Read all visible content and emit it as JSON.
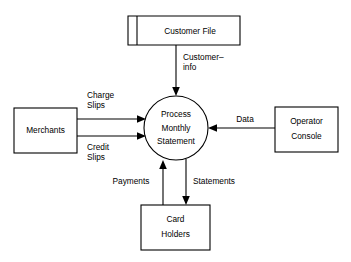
{
  "diagram": {
    "type": "data-flow-diagram",
    "nodes": {
      "data_store": {
        "label": "Customer File",
        "shape": "open-ended-rectangle"
      },
      "process": {
        "label_line1": "Process",
        "label_line2": "Monthly",
        "label_line3": "Statement",
        "shape": "circle"
      },
      "merchants": {
        "label": "Merchants",
        "shape": "rectangle"
      },
      "operator_console": {
        "label_line1": "Operator",
        "label_line2": "Console",
        "shape": "rectangle"
      },
      "card_holders": {
        "label_line1": "Card",
        "label_line2": "Holders",
        "shape": "rectangle"
      }
    },
    "flows": [
      {
        "id": "customer-info",
        "label_line1": "Customer–",
        "label_line2": "info",
        "from": "Customer File",
        "to": "Process Monthly Statement",
        "direction": "down"
      },
      {
        "id": "charge-slips",
        "label_line1": "Charge",
        "label_line2": "Slips",
        "from": "Merchants",
        "to": "Process Monthly Statement",
        "direction": "right"
      },
      {
        "id": "credit-slips",
        "label_line1": "Credit",
        "label_line2": "Slips",
        "from": "Merchants",
        "to": "Process Monthly Statement",
        "direction": "right"
      },
      {
        "id": "data",
        "label_line1": "Data",
        "from": "Operator Console",
        "to": "Process Monthly Statement",
        "direction": "left"
      },
      {
        "id": "payments",
        "label_line1": "Payments",
        "from": "Card Holders",
        "to": "Process Monthly Statement",
        "direction": "up"
      },
      {
        "id": "statements",
        "label_line1": "Statements",
        "from": "Process Monthly Statement",
        "to": "Card Holders",
        "direction": "down"
      }
    ],
    "colors": {
      "stroke": "#000000",
      "fill": "#ffffff",
      "text": "#000000"
    }
  }
}
